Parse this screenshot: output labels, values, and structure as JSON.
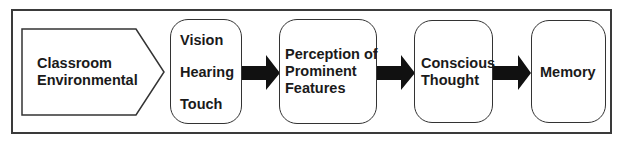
{
  "diagram": {
    "title": "",
    "nodes": [
      {
        "id": "classroom",
        "shape": "pentagon-arrow",
        "lines": [
          "Classroom",
          "Environmental"
        ]
      },
      {
        "id": "senses",
        "shape": "rounded-rect",
        "lines": [
          "Vision",
          "Hearing",
          "Touch"
        ]
      },
      {
        "id": "perception",
        "shape": "rounded-rect",
        "lines": [
          "Perception of",
          "Prominent",
          "Features"
        ]
      },
      {
        "id": "conscious",
        "shape": "rounded-rect",
        "lines": [
          "Conscious",
          "Thought"
        ]
      },
      {
        "id": "memory",
        "shape": "rounded-rect",
        "lines": [
          "Memory"
        ]
      }
    ],
    "edges": [
      {
        "from": "classroom",
        "to": "senses",
        "style": "adjacent"
      },
      {
        "from": "senses",
        "to": "perception",
        "style": "block-arrow"
      },
      {
        "from": "perception",
        "to": "conscious",
        "style": "block-arrow"
      },
      {
        "from": "conscious",
        "to": "memory",
        "style": "block-arrow"
      }
    ],
    "colors": {
      "stroke": "#333333",
      "arrow": "#111111",
      "text": "#1a1a1a",
      "background": "#ffffff"
    }
  }
}
